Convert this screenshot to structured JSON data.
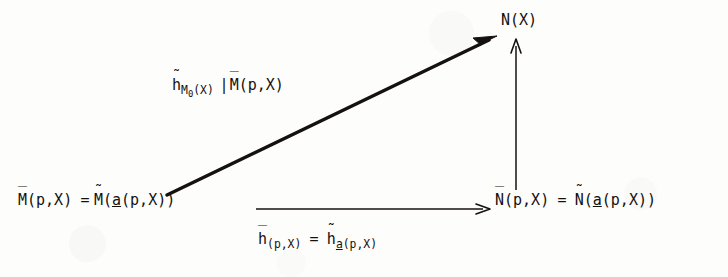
{
  "diagram": {
    "type": "commutative-diagram",
    "background_color": "#fdfdfc",
    "ink_color": "#15110f",
    "nodes": [
      {
        "id": "M",
        "plain": "M̄(p,X) = M̃(a̲(p,X))",
        "position": "bottom-left",
        "parts": {
          "lhs_base": "M",
          "lhs_accent": "bar",
          "lhs_args": "(p,X)",
          "equals": "=",
          "rhs_base": "M",
          "rhs_accent": "tilde",
          "rhs_open": "(",
          "rhs_inner_var": "a",
          "rhs_inner_args": "(p,X)",
          "rhs_close": ")"
        }
      },
      {
        "id": "N",
        "plain": "N̄(p,X) = Ñ(a̲(p,X))",
        "position": "bottom-right",
        "parts": {
          "lhs_base": "N",
          "lhs_accent": "bar",
          "lhs_args": "(p,X)",
          "equals": "=",
          "rhs_base": "N",
          "rhs_accent": "tilde",
          "rhs_open": "(",
          "rhs_inner_var": "a",
          "rhs_inner_args": "(p,X)",
          "rhs_close": ")"
        }
      },
      {
        "id": "NX",
        "plain": "N(X)",
        "position": "top-right",
        "parts": {
          "base": "N",
          "args": "(X)"
        }
      }
    ],
    "edges": [
      {
        "id": "diagonal",
        "from": "M",
        "to": "NX",
        "style": "solid",
        "arrowhead": "filled",
        "thick": true,
        "label_plain": "h̃_{M₀(X)} | M̄(p,X)",
        "label_parts": {
          "h_base": "h",
          "h_accent": "tilde",
          "sub_base": "M",
          "sub_index": "0",
          "sub_args": "(X)",
          "restriction_bar": "|",
          "restricted_base": "M",
          "restricted_accent": "bar",
          "restricted_args": "(p,X)"
        }
      },
      {
        "id": "horizontal",
        "from": "M",
        "to": "N",
        "style": "solid",
        "arrowhead": "open",
        "thick": false,
        "label_plain": "h̄_(p,X) = h̃_a̲(p,X)",
        "label_parts": {
          "lhs_base": "h",
          "lhs_accent": "bar",
          "lhs_sub": "(p,X)",
          "equals": "=",
          "rhs_base": "h",
          "rhs_accent": "tilde",
          "rhs_sub_var": "a",
          "rhs_sub_args": "(p,X)"
        }
      },
      {
        "id": "vertical",
        "from": "N",
        "to": "NX",
        "style": "solid",
        "arrowhead": "open",
        "thick": false,
        "label_plain": ""
      }
    ]
  }
}
